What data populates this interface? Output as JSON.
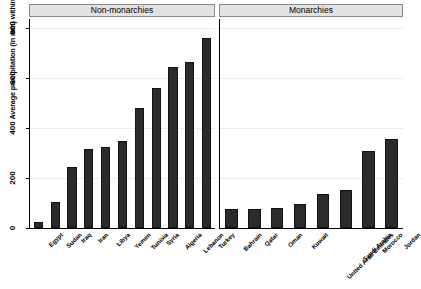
{
  "chart_data": {
    "type": "bar",
    "title": "",
    "xlabel": "",
    "ylabel": "Average precipitation (in mm) within 50 miles of largest city",
    "ylim": [
      0,
      800
    ],
    "yticks": [
      0,
      200,
      400,
      600,
      800
    ],
    "grid": true,
    "legend": "none",
    "orientation": "vertical",
    "bar_color": "#2b2b2b",
    "panels": [
      {
        "label": "Non-monarchies",
        "categories": [
          "Egypt",
          "Sudan",
          "Iraq",
          "Iran",
          "Libya",
          "Yemen",
          "Tunisia",
          "Syria",
          "Algeria",
          "Lebanon",
          "Turkey"
        ],
        "values": [
          25,
          105,
          245,
          315,
          325,
          350,
          480,
          560,
          645,
          665,
          760
        ]
      },
      {
        "label": "Monarchies",
        "categories": [
          "Bahrain",
          "Qatar",
          "Oman",
          "Kuwait",
          "United Arab Emirates",
          "Saudi Arabia",
          "Morocco",
          "Jordan"
        ],
        "values": [
          75,
          78,
          82,
          97,
          138,
          152,
          310,
          355
        ]
      }
    ]
  },
  "axis": {
    "y_title": "Average precipitation (in mm) within 50 miles of largest city",
    "ticks": [
      "0",
      "200",
      "400",
      "600",
      "800"
    ]
  },
  "panel_left": {
    "strip_label": "Non-monarchies",
    "labels": [
      "Egypt",
      "Sudan",
      "Iraq",
      "Iran",
      "Libya",
      "Yemen",
      "Tunisia",
      "Syria",
      "Algeria",
      "Lebanon",
      "Turkey"
    ]
  },
  "panel_right": {
    "strip_label": "Monarchies",
    "labels": [
      "Bahrain",
      "Qatar",
      "Oman",
      "Kuwait",
      "United Arab Emirates",
      "Saudi Arabia",
      "Morocco",
      "Jordan"
    ]
  }
}
